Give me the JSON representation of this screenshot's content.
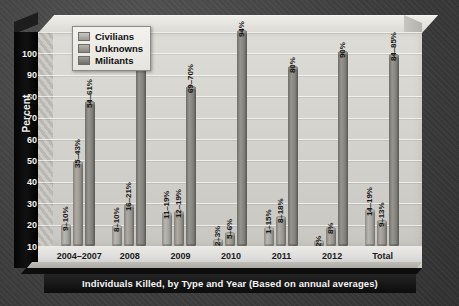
{
  "chart_data": {
    "type": "bar",
    "title": "",
    "xlabel": "Individuals Killed, by Type and Year (Based on annual averages)",
    "ylabel": "Percent",
    "ylim": [
      0,
      100
    ],
    "yticks": [
      100,
      90,
      80,
      70,
      60,
      50,
      40,
      30,
      20,
      10,
      0
    ],
    "grid": true,
    "legend_position": "top-left",
    "categories": [
      "2004–2007",
      "2008",
      "2009",
      "2010",
      "2011",
      "2012",
      "Total"
    ],
    "series": [
      {
        "name": "Civilians",
        "color": "#b9b7b1",
        "values": [
          9.5,
          9.0,
          15.0,
          2.5,
          8.0,
          2.0,
          16.5
        ],
        "labels": [
          "9–10%",
          "8–10%",
          "11–19%",
          "2–3%",
          "1–15%",
          "2%",
          "14–19%"
        ]
      },
      {
        "name": "Unknowns",
        "color": "#adaba4",
        "values": [
          39.0,
          18.5,
          15.5,
          5.5,
          13.0,
          8.0,
          11.0
        ],
        "labels": [
          "35–43%",
          "16–21%",
          "12–19%",
          "5–6%",
          "8–18%",
          "8%",
          "9–13%"
        ]
      },
      {
        "name": "Militants",
        "color": "#979590",
        "values": [
          67.0,
          89.0,
          74.0,
          100.0,
          83.0,
          90.0,
          89.0
        ],
        "labels": [
          "54–61%",
          "80–84%",
          "69–70%",
          "94%",
          "80%",
          "90%",
          "84–85%"
        ]
      }
    ]
  },
  "legend": {
    "items": [
      {
        "label": "Civilians"
      },
      {
        "label": "Unknowns"
      },
      {
        "label": "Militants"
      }
    ]
  },
  "axes": {
    "y_title": "Percent",
    "x_title": "Individuals Killed, by Type and Year (Based on annual averages)"
  }
}
